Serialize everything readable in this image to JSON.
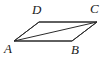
{
  "figure": {
    "kind": "geometry-diagram",
    "shape_name": "parallelogram",
    "background_color": "#ffffff",
    "stroke_color": "#2b2b2b",
    "label_color": "#1a1a1a",
    "stroke_width": 1,
    "canvas": {
      "width": 110,
      "height": 59
    },
    "vertices": [
      {
        "id": "A",
        "label": "A",
        "x": 14,
        "y": 41,
        "label_x": 4,
        "label_y": 42,
        "position": "bottom-left"
      },
      {
        "id": "B",
        "label": "B",
        "x": 72,
        "y": 41,
        "label_x": 71,
        "label_y": 43,
        "position": "bottom-right"
      },
      {
        "id": "C",
        "label": "C",
        "x": 97,
        "y": 22,
        "label_x": 90,
        "label_y": 2,
        "position": "top-right"
      },
      {
        "id": "D",
        "label": "D",
        "x": 39,
        "y": 22,
        "label_x": 32,
        "label_y": 3,
        "position": "top-left"
      }
    ],
    "edges": [
      {
        "id": "AB",
        "from": "A",
        "to": "B",
        "type": "side"
      },
      {
        "id": "BC",
        "from": "B",
        "to": "C",
        "type": "side"
      },
      {
        "id": "CD",
        "from": "C",
        "to": "D",
        "type": "side"
      },
      {
        "id": "DA",
        "from": "D",
        "to": "A",
        "type": "side"
      }
    ],
    "diagonals": [
      {
        "id": "AC",
        "from": "A",
        "to": "C",
        "type": "diagonal"
      }
    ],
    "outline_points": "14,41 72,41 97,22 39,22"
  }
}
